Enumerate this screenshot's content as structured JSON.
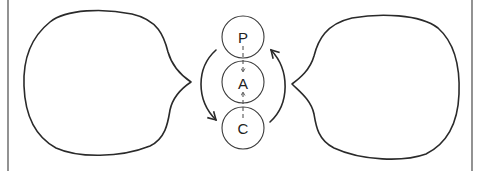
{
  "diagram": {
    "nodes": [
      {
        "id": "P",
        "label": "P",
        "cx": 243,
        "cy": 37,
        "r": 21
      },
      {
        "id": "A",
        "label": "A",
        "cx": 243,
        "cy": 82,
        "r": 21
      },
      {
        "id": "C",
        "label": "C",
        "cx": 243,
        "cy": 128,
        "r": 21
      }
    ],
    "edges": [
      {
        "from": "P",
        "to": "A",
        "style": "dashed",
        "arrow": "down"
      },
      {
        "from": "C",
        "to": "A",
        "style": "dashed",
        "arrow": "up"
      },
      {
        "from": "P",
        "to": "C",
        "style": "curved-left",
        "arrow": "end"
      },
      {
        "from": "C",
        "to": "P",
        "style": "curved-right",
        "arrow": "end"
      }
    ],
    "bubbles": [
      {
        "id": "left-bubble",
        "side": "left",
        "pointing": "right"
      },
      {
        "id": "right-bubble",
        "side": "right",
        "pointing": "left"
      }
    ],
    "colors": {
      "stroke": "#2a2a2a",
      "background": "#ffffff"
    }
  }
}
